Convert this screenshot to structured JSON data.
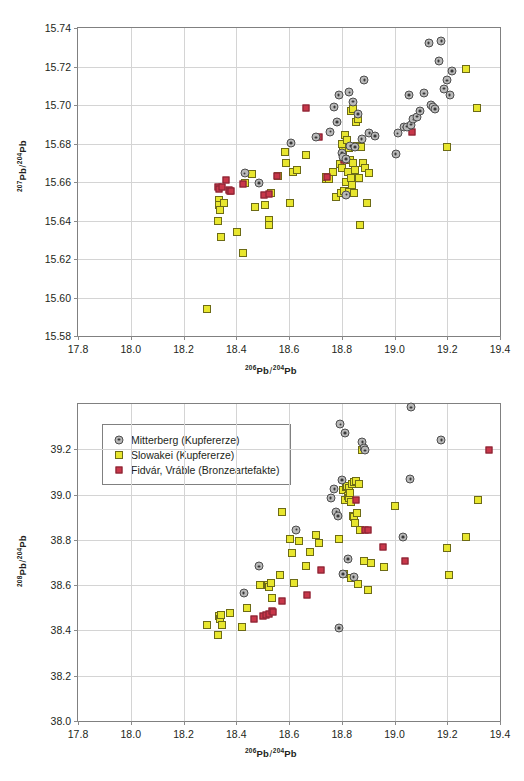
{
  "figure": {
    "marker_colors": {
      "mitterberg_fill": "#b9b9b9",
      "mitterberg_edge": "#4d4d4d",
      "slowakei_fill": "#e8e62e",
      "slowakei_edge": "#6d6b16",
      "fidvar_fill": "#c9374a",
      "fidvar_edge": "#7d2330",
      "grid": "#d4d4d4",
      "frame": "#808080"
    },
    "legend": {
      "position": "top-left-of-bottom-chart",
      "entries": [
        {
          "label": "Mitterberg (Kupfererze)",
          "marker": "circle-gray"
        },
        {
          "label": "Slowakei (Kupfererze)",
          "marker": "square-yellow"
        },
        {
          "label": "Fidvár, Vráble (Bronzeartefakte)",
          "marker": "square-red"
        }
      ]
    }
  },
  "chart_data": [
    {
      "type": "scatter",
      "id": "pb207-vs-pb206",
      "title": "",
      "xlabel_parts": {
        "sup1": "206",
        "base1": "Pb",
        "sep": "/",
        "sup2": "204",
        "base2": "Pb"
      },
      "ylabel_parts": {
        "sup1": "207",
        "base1": "Pb",
        "sep": "/",
        "sup2": "204",
        "base2": "Pb"
      },
      "xlabel": "206Pb/204Pb",
      "ylabel": "207Pb/204Pb",
      "xlim": [
        17.8,
        19.4
      ],
      "ylim": [
        15.58,
        15.74
      ],
      "xticks": [
        "17.8",
        "18.0",
        "18.2",
        "18.4",
        "18.6",
        "18.8",
        "19.0",
        "19.2",
        "19.4"
      ],
      "yticks": [
        "15.58",
        "15.60",
        "15.62",
        "15.64",
        "15.66",
        "15.68",
        "15.70",
        "15.72",
        "15.74"
      ],
      "grid": true,
      "legend_shown": false,
      "series": [
        {
          "name": "Mitterberg (Kupfererze)",
          "marker": "circle-gray",
          "points": [
            [
              18.432,
              15.6645
            ],
            [
              18.487,
              15.6595
            ],
            [
              18.607,
              15.6802
            ],
            [
              18.703,
              15.6832
            ],
            [
              18.757,
              15.6862
            ],
            [
              18.772,
              15.699
            ],
            [
              18.781,
              15.6912
            ],
            [
              18.788,
              15.7052
            ],
            [
              18.8,
              15.6752
            ],
            [
              18.806,
              15.6728
            ],
            [
              18.815,
              15.6718
            ],
            [
              18.818,
              15.6535
            ],
            [
              18.829,
              15.7065
            ],
            [
              18.833,
              15.6787
            ],
            [
              18.843,
              15.7018
            ],
            [
              18.851,
              15.6782
            ],
            [
              18.862,
              15.6952
            ],
            [
              18.875,
              15.6822
            ],
            [
              18.886,
              15.713
            ],
            [
              18.905,
              15.6855
            ],
            [
              18.925,
              15.6838
            ],
            [
              19.004,
              15.6745
            ],
            [
              19.012,
              15.6852
            ],
            [
              19.037,
              15.6885
            ],
            [
              19.046,
              15.6888
            ],
            [
              19.055,
              15.7052
            ],
            [
              19.063,
              15.6898
            ],
            [
              19.072,
              15.6925
            ],
            [
              19.085,
              15.694
            ],
            [
              19.097,
              15.6968
            ],
            [
              19.112,
              15.706
            ],
            [
              19.129,
              15.7322
            ],
            [
              19.137,
              15.6998
            ],
            [
              19.146,
              15.6988
            ],
            [
              19.154,
              15.6978
            ],
            [
              19.167,
              15.7228
            ],
            [
              19.178,
              15.7332
            ],
            [
              19.187,
              15.7085
            ],
            [
              19.198,
              15.7128
            ],
            [
              19.209,
              15.7052
            ],
            [
              19.219,
              15.7178
            ]
          ]
        },
        {
          "name": "Slowakei (Kupfererze)",
          "marker": "square-yellow",
          "points": [
            [
              18.288,
              15.594
            ],
            [
              18.33,
              15.6395
            ],
            [
              18.333,
              15.6505
            ],
            [
              18.336,
              15.6478
            ],
            [
              18.338,
              15.6455
            ],
            [
              18.341,
              15.6315
            ],
            [
              18.352,
              15.649
            ],
            [
              18.404,
              15.6338
            ],
            [
              18.426,
              15.623
            ],
            [
              18.433,
              15.6595
            ],
            [
              18.459,
              15.664
            ],
            [
              18.47,
              15.6472
            ],
            [
              18.51,
              15.6478
            ],
            [
              18.523,
              15.6402
            ],
            [
              18.526,
              15.6378
            ],
            [
              18.531,
              15.6542
            ],
            [
              18.557,
              15.663
            ],
            [
              18.583,
              15.6758
            ],
            [
              18.59,
              15.67
            ],
            [
              18.603,
              15.649
            ],
            [
              18.616,
              15.6652
            ],
            [
              18.632,
              15.6662
            ],
            [
              18.663,
              15.6742
            ],
            [
              18.739,
              15.6618
            ],
            [
              18.742,
              15.6628
            ],
            [
              18.75,
              15.6615
            ],
            [
              18.766,
              15.6652
            ],
            [
              18.78,
              15.6522
            ],
            [
              18.792,
              15.6695
            ],
            [
              18.796,
              15.6545
            ],
            [
              18.8,
              15.68
            ],
            [
              18.802,
              15.6672
            ],
            [
              18.806,
              15.6762
            ],
            [
              18.809,
              15.6552
            ],
            [
              18.812,
              15.6845
            ],
            [
              18.814,
              15.6722
            ],
            [
              18.818,
              15.66
            ],
            [
              18.821,
              15.682
            ],
            [
              18.823,
              15.6652
            ],
            [
              18.826,
              15.6548
            ],
            [
              18.829,
              15.6775
            ],
            [
              18.831,
              15.6715
            ],
            [
              18.834,
              15.6968
            ],
            [
              18.836,
              15.662
            ],
            [
              18.838,
              15.6585
            ],
            [
              18.841,
              15.6978
            ],
            [
              18.843,
              15.67
            ],
            [
              18.846,
              15.6545
            ],
            [
              18.849,
              15.6782
            ],
            [
              18.852,
              15.6662
            ],
            [
              18.855,
              15.691
            ],
            [
              18.858,
              15.6788
            ],
            [
              18.862,
              15.6925
            ],
            [
              18.866,
              15.6622
            ],
            [
              18.87,
              15.6378
            ],
            [
              18.874,
              15.6782
            ],
            [
              18.881,
              15.67
            ],
            [
              18.889,
              15.6672
            ],
            [
              18.895,
              15.649
            ],
            [
              18.904,
              15.6645
            ],
            [
              19.198,
              15.678
            ],
            [
              19.272,
              15.7188
            ],
            [
              19.312,
              15.6985
            ]
          ]
        },
        {
          "name": "Fidvár, Vráble (Bronzeartefakte)",
          "marker": "square-red",
          "points": [
            [
              18.33,
              15.6572
            ],
            [
              18.335,
              15.6565
            ],
            [
              18.346,
              15.6572
            ],
            [
              18.362,
              15.661
            ],
            [
              18.371,
              15.6558
            ],
            [
              18.376,
              15.6552
            ],
            [
              18.381,
              15.6555
            ],
            [
              18.424,
              15.659
            ],
            [
              18.507,
              15.653
            ],
            [
              18.524,
              15.654
            ],
            [
              18.553,
              15.663
            ],
            [
              18.666,
              15.6982
            ],
            [
              18.714,
              15.6832
            ],
            [
              18.743,
              15.6625
            ],
            [
              18.808,
              15.6715
            ],
            [
              19.066,
              15.6862
            ]
          ]
        }
      ]
    },
    {
      "type": "scatter",
      "id": "pb208-vs-pb206",
      "title": "",
      "xlabel_parts": {
        "sup1": "206",
        "base1": "Pb",
        "sep": "/",
        "sup2": "204",
        "base2": "Pb"
      },
      "ylabel_parts": {
        "sup1": "208",
        "base1": "Pb",
        "sep": "/",
        "sup2": "204",
        "base2": "Pb"
      },
      "xlabel": "206Pb/204Pb",
      "ylabel": "208Pb/204Pb",
      "xlim": [
        17.8,
        19.4
      ],
      "ylim": [
        38.0,
        39.4
      ],
      "xticks": [
        "17.8",
        "18.0",
        "18.2",
        "18.4",
        "18.6",
        "18.8",
        "19.0",
        "19.2",
        "19.4"
      ],
      "yticks": [
        "38.0",
        "38.2",
        "38.4",
        "38.6",
        "38.8",
        "39.0",
        "39.2"
      ],
      "grid": true,
      "legend_shown": true,
      "series": [
        {
          "name": "Mitterberg (Kupfererze)",
          "marker": "circle-gray",
          "points": [
            [
              18.428,
              38.565
            ],
            [
              18.487,
              38.683
            ],
            [
              18.628,
              38.845
            ],
            [
              18.758,
              38.985
            ],
            [
              18.772,
              39.025
            ],
            [
              18.78,
              38.925
            ],
            [
              18.785,
              38.905
            ],
            [
              18.79,
              38.41
            ],
            [
              18.795,
              39.31
            ],
            [
              18.8,
              39.065
            ],
            [
              18.805,
              38.65
            ],
            [
              18.812,
              39.272
            ],
            [
              18.823,
              38.715
            ],
            [
              18.845,
              38.635
            ],
            [
              18.878,
              39.232
            ],
            [
              18.884,
              39.205
            ],
            [
              18.888,
              39.195
            ],
            [
              19.032,
              38.812
            ],
            [
              19.06,
              39.07
            ],
            [
              19.062,
              39.385
            ],
            [
              19.178,
              39.24
            ]
          ]
        },
        {
          "name": "Slowakei (Kupfererze)",
          "marker": "square-yellow",
          "points": [
            [
              18.288,
              38.422
            ],
            [
              18.33,
              38.378
            ],
            [
              18.335,
              38.462
            ],
            [
              18.338,
              38.452
            ],
            [
              18.343,
              38.47
            ],
            [
              18.347,
              38.425
            ],
            [
              18.378,
              38.475
            ],
            [
              18.422,
              38.415
            ],
            [
              18.44,
              38.5
            ],
            [
              18.49,
              38.6
            ],
            [
              18.52,
              38.6
            ],
            [
              18.524,
              38.592
            ],
            [
              18.53,
              38.61
            ],
            [
              18.534,
              38.545
            ],
            [
              18.565,
              38.645
            ],
            [
              18.572,
              38.922
            ],
            [
              18.602,
              38.805
            ],
            [
              18.612,
              38.742
            ],
            [
              18.62,
              38.608
            ],
            [
              18.637,
              38.795
            ],
            [
              18.665,
              38.685
            ],
            [
              18.68,
              38.748
            ],
            [
              18.702,
              38.82
            ],
            [
              18.712,
              38.785
            ],
            [
              18.79,
              38.805
            ],
            [
              18.806,
              39.02
            ],
            [
              18.81,
              38.648
            ],
            [
              18.814,
              38.975
            ],
            [
              18.818,
              39.035
            ],
            [
              18.82,
              39.04
            ],
            [
              18.823,
              38.995
            ],
            [
              18.826,
              39.028
            ],
            [
              18.829,
              38.985
            ],
            [
              18.831,
              39.005
            ],
            [
              18.834,
              38.968
            ],
            [
              18.836,
              38.63
            ],
            [
              18.839,
              39.048
            ],
            [
              18.842,
              38.905
            ],
            [
              18.845,
              39.055
            ],
            [
              18.848,
              38.9
            ],
            [
              18.851,
              38.875
            ],
            [
              18.854,
              39.062
            ],
            [
              18.858,
              38.92
            ],
            [
              18.862,
              38.605
            ],
            [
              18.866,
              39.045
            ],
            [
              18.87,
              38.845
            ],
            [
              18.875,
              39.195
            ],
            [
              18.886,
              38.705
            ],
            [
              18.9,
              38.578
            ],
            [
              18.912,
              38.7
            ],
            [
              18.962,
              38.68
            ],
            [
              19.0,
              38.95
            ],
            [
              19.198,
              38.765
            ],
            [
              19.205,
              38.645
            ],
            [
              19.272,
              38.812
            ],
            [
              19.318,
              38.978
            ]
          ]
        },
        {
          "name": "Fidvár, Vráble (Bronzeartefakte)",
          "marker": "square-red",
          "points": [
            [
              18.466,
              38.452
            ],
            [
              18.5,
              38.465
            ],
            [
              18.512,
              38.468
            ],
            [
              18.525,
              38.472
            ],
            [
              18.534,
              38.485
            ],
            [
              18.538,
              38.482
            ],
            [
              18.572,
              38.53
            ],
            [
              18.668,
              38.558
            ],
            [
              18.722,
              38.668
            ],
            [
              18.855,
              38.978
            ],
            [
              18.89,
              38.845
            ],
            [
              18.898,
              38.845
            ],
            [
              18.955,
              38.768
            ],
            [
              19.04,
              38.705
            ],
            [
              19.358,
              39.195
            ]
          ]
        }
      ]
    }
  ]
}
